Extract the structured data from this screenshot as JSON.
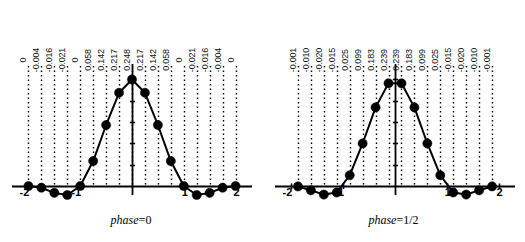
{
  "figure": {
    "background_color": "#ffffff",
    "ink_color": "#000000",
    "panel_count": 2
  },
  "chart_data": [
    {
      "type": "line",
      "title": "phase=0",
      "caption_label": "phase",
      "caption_value": "0",
      "xlabel": "",
      "ylabel": "",
      "grid": true,
      "grid_style": "vertical dotted lines at each sample",
      "legend": "none",
      "markers": "filled circles",
      "xlim": [
        -2.125,
        2.125
      ],
      "ylim": [
        -0.035,
        0.27
      ],
      "xticks": [
        -2,
        -1,
        1,
        2
      ],
      "xtick_labels": [
        "-2",
        "-1",
        "1",
        "2"
      ],
      "x": [
        -2,
        -1.75,
        -1.5,
        -1.25,
        -1,
        -0.75,
        -0.5,
        -0.25,
        0,
        0.25,
        0.5,
        0.75,
        1,
        1.25,
        1.5,
        1.75,
        2
      ],
      "values": [
        0,
        -0.004,
        -0.016,
        -0.021,
        0,
        0.058,
        0.142,
        0.217,
        0.248,
        0.217,
        0.142,
        0.058,
        0,
        -0.021,
        -0.016,
        -0.004,
        0
      ],
      "point_labels": [
        "0",
        "-0.004",
        "-0.016",
        "-0.021",
        "0",
        "0.058",
        "0.142",
        "0.217",
        "0.248",
        "0.217",
        "0.142",
        "0.058",
        "0",
        "-0.021",
        "-0.016",
        "-0.004",
        "0"
      ],
      "peak_value": 0.248,
      "n_points": 17
    },
    {
      "type": "line",
      "title": "phase=1/2",
      "caption_label": "phase",
      "caption_value": "1/2",
      "xlabel": "",
      "ylabel": "",
      "grid": true,
      "grid_style": "vertical dotted lines at each sample",
      "legend": "none",
      "markers": "filled circles",
      "xlim": [
        -2.125,
        2.125
      ],
      "ylim": [
        -0.035,
        0.27
      ],
      "xticks": [
        -2,
        -1,
        1,
        2
      ],
      "xtick_labels": [
        "-2",
        "-1",
        "1",
        "2"
      ],
      "x": [
        -1.875,
        -1.625,
        -1.375,
        -1.125,
        -0.875,
        -0.625,
        -0.375,
        -0.125,
        0.125,
        0.375,
        0.625,
        0.875,
        1.125,
        1.375,
        1.625,
        1.875
      ],
      "values": [
        -0.001,
        -0.01,
        -0.02,
        -0.015,
        0.025,
        0.099,
        0.183,
        0.239,
        0.239,
        0.183,
        0.099,
        0.025,
        -0.015,
        -0.02,
        -0.01,
        -0.001
      ],
      "point_labels": [
        "-0.001",
        "-0.010",
        "-0.020",
        "-0.015",
        "0.025",
        "0.099",
        "0.183",
        "0.239",
        "0.239",
        "0.183",
        "0.099",
        "0.025",
        "-0.015",
        "-0.020",
        "-0.010",
        "-0.001"
      ],
      "peak_value": 0.239,
      "n_points": 16
    }
  ]
}
